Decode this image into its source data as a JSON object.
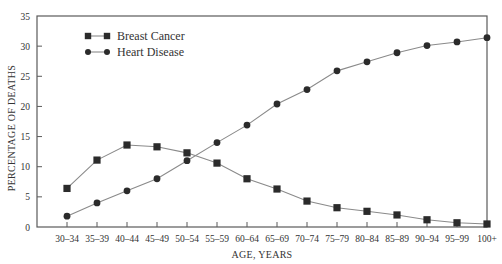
{
  "chart_data": {
    "type": "line",
    "title": "",
    "xlabel": "AGE, YEARS",
    "ylabel": "PERCENTAGE OF DEATHS",
    "ylim": [
      0,
      35
    ],
    "yticks": [
      0,
      5,
      10,
      15,
      20,
      25,
      30,
      35
    ],
    "grid": false,
    "legend_position": "upper left",
    "categories": [
      "30–34",
      "35–39",
      "40–44",
      "45–49",
      "50–54",
      "55–59",
      "60–64",
      "65–69",
      "70–74",
      "75–79",
      "80–84",
      "85–89",
      "90–94",
      "95–99",
      "100+"
    ],
    "series": [
      {
        "name": "Breast Cancer",
        "marker": "square",
        "values": [
          6.4,
          11.1,
          13.6,
          13.3,
          12.3,
          10.6,
          8.0,
          6.3,
          4.3,
          3.2,
          2.6,
          2.0,
          1.2,
          0.7,
          0.5
        ]
      },
      {
        "name": "Heart Disease",
        "marker": "circle",
        "values": [
          1.8,
          4.0,
          6.0,
          8.0,
          11.0,
          14.0,
          16.9,
          20.4,
          22.8,
          25.9,
          27.4,
          28.9,
          30.1,
          30.7,
          31.4
        ]
      }
    ]
  },
  "colors": {
    "line": "#8a8a8a",
    "marker": "#2b2b2b",
    "axis": "#5a5a5a",
    "text": "#333333"
  }
}
